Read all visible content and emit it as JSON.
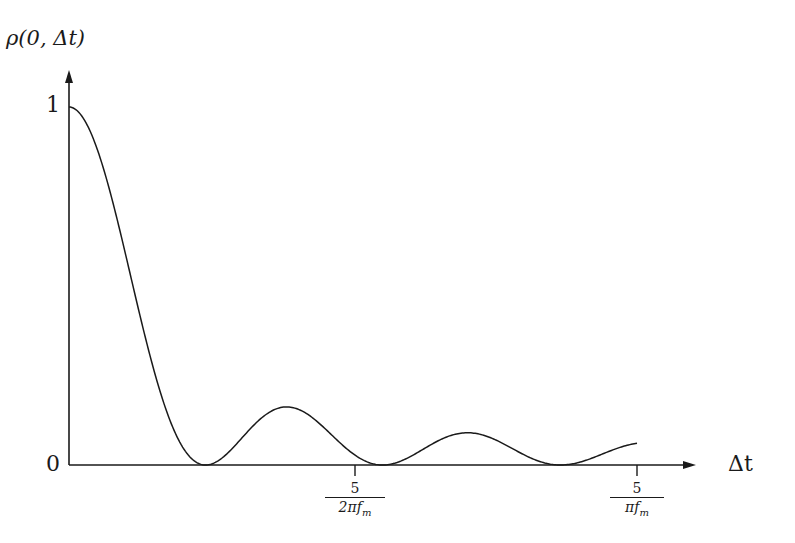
{
  "chart_data": {
    "type": "line",
    "title": "",
    "ylabel": "ρ(0, Δt)",
    "xlabel": "Δt",
    "y_ticks": [
      {
        "label": "0",
        "value": 0
      },
      {
        "label": "1",
        "value": 1
      }
    ],
    "x_ticks": [
      {
        "label_num": "5",
        "label_den": "2πf_m",
        "value_2pi_fm_dt": 5
      },
      {
        "label_num": "5",
        "label_den": "πf_m",
        "value_2pi_fm_dt": 10
      }
    ],
    "ylim": [
      0,
      1.1
    ],
    "xlim_2pi_fm_dt": [
      0,
      11
    ],
    "grid": false,
    "legend": null,
    "function": "J0(2π f_m Δt)^2",
    "series": [
      {
        "name": "ρ(0, Δt)",
        "x_2pi_fm_dt": [
          0,
          0.5,
          1.0,
          1.5,
          2.0,
          2.405,
          3.0,
          3.832,
          4.5,
          5.0,
          5.52,
          6.0,
          7.016,
          8.0,
          8.654,
          9.0,
          10.0
        ],
        "values": [
          1.0,
          0.8819,
          0.5855,
          0.261,
          0.0501,
          0.0,
          0.0677,
          0.1622,
          0.101,
          0.0315,
          0.0,
          0.0227,
          0.09,
          0.0294,
          0.0,
          0.0081,
          0.0604
        ]
      }
    ],
    "features": {
      "zeros_2pi_fm_dt": [
        2.405,
        5.52,
        8.654
      ],
      "local_maxima": [
        {
          "x_2pi_fm_dt": 0,
          "value": 1.0
        },
        {
          "x_2pi_fm_dt": 3.832,
          "value": 0.162
        },
        {
          "x_2pi_fm_dt": 7.016,
          "value": 0.09
        }
      ]
    }
  },
  "labels": {
    "y_axis": "ρ(0, Δt)",
    "x_axis": "Δt",
    "y_tick_one": "1",
    "y_tick_zero": "0",
    "x_tick1_num": "5",
    "x_tick1_den_main": "2πf",
    "x_tick1_den_sub": "m",
    "x_tick2_num": "5",
    "x_tick2_den_main": "πf",
    "x_tick2_den_sub": "m"
  },
  "colors": {
    "line": "#1a1a1a",
    "background": "#ffffff"
  }
}
